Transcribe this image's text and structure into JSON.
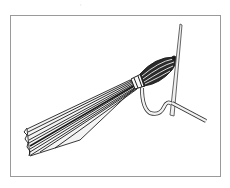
{
  "figure": {
    "caption_fragment": "‚",
    "colors": {
      "frame": "#9a9a9a",
      "ink": "#1a1a1a",
      "paper": "#ffffff",
      "thread_fill": "#f2f2f2"
    }
  }
}
